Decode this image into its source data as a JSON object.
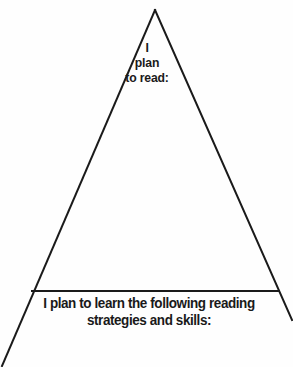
{
  "page": {
    "background_color": "#fefefe",
    "ink_color": "#1a1a1a",
    "width": 293,
    "height": 367
  },
  "diagram": {
    "shape_name": "triangle",
    "stroke_color": "#1a1a1a",
    "stroke_width": 2,
    "apex": {
      "x": 155,
      "y": 10
    },
    "left_leg_end": {
      "x": 2,
      "y": 366
    },
    "right_leg_end": {
      "x": 292,
      "y": 320
    },
    "divider_line": {
      "x1": 32,
      "y1": 291,
      "x2": 279,
      "y2": 291
    }
  },
  "apex_prompt": {
    "name": "i-plan-to-read-prompt",
    "lines": [
      "I",
      "plan",
      "to read:"
    ],
    "full_text": "I plan to read:"
  },
  "base_prompt": {
    "name": "i-plan-to-learn-prompt",
    "lines": [
      "I plan to learn the following reading",
      "strategies and skills:"
    ],
    "full_text": "I plan to learn the following reading strategies and skills:"
  }
}
